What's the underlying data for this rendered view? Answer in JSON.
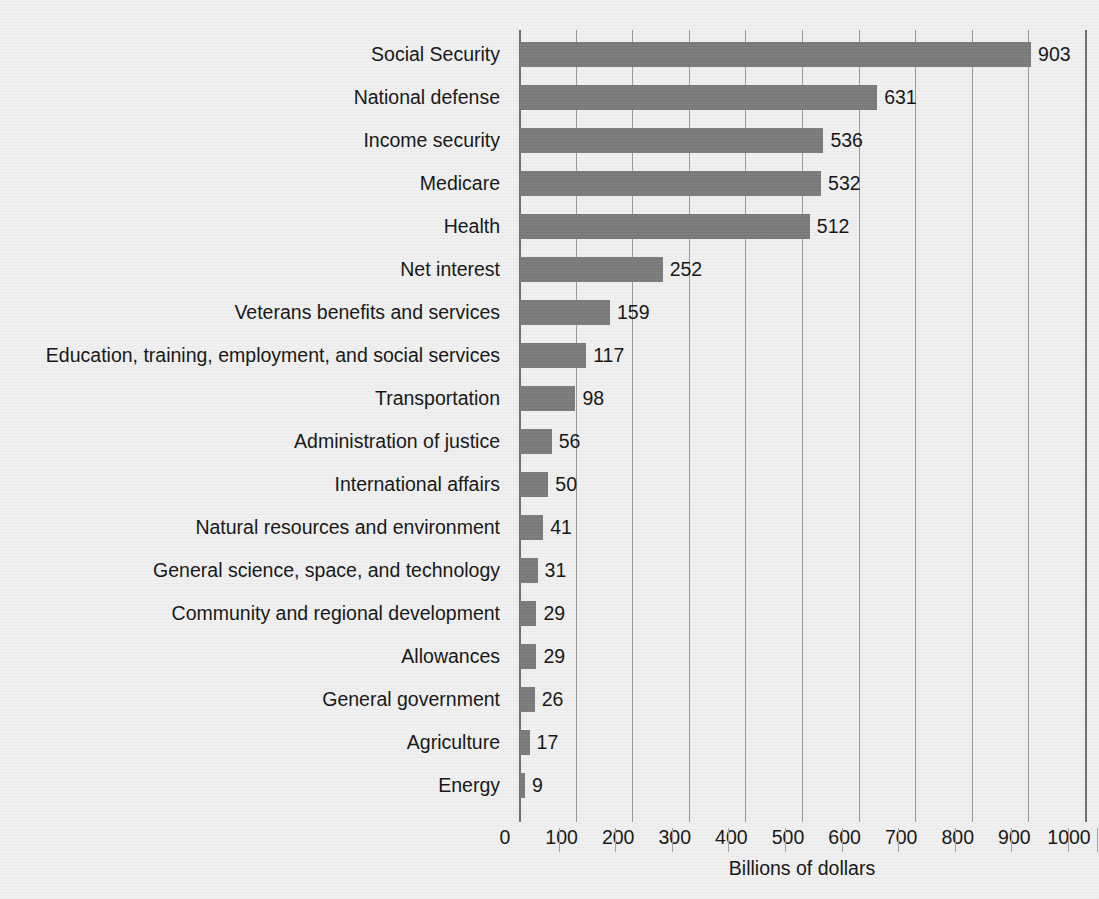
{
  "chart_data": {
    "type": "bar",
    "orientation": "horizontal",
    "title": "",
    "subtitle": "",
    "xlabel": "Billions of dollars",
    "ylabel": "",
    "xlim": [
      0,
      1000
    ],
    "xticks": [
      0,
      100,
      200,
      300,
      400,
      500,
      600,
      700,
      800,
      900,
      1000
    ],
    "xtick_labels": [
      "0",
      "100",
      "200",
      "300",
      "400",
      "500",
      "600",
      "700",
      "800",
      "900",
      "1000"
    ],
    "grid": true,
    "grid_axis": "x",
    "legend": false,
    "bar_color": "#7a7a7a",
    "background_color": "#eff0ef",
    "value_labels": true,
    "categories": [
      "Social Security",
      "National defense",
      "Income security",
      "Medicare",
      "Health",
      "Net interest",
      "Veterans benefits and services",
      "Education, training, employment, and social services",
      "Transportation",
      "Administration of justice",
      "International affairs",
      "Natural resources and environment",
      "General science, space, and technology",
      "Community and regional development",
      "Allowances",
      "General government",
      "Agriculture",
      "Energy"
    ],
    "values": [
      903,
      631,
      536,
      532,
      512,
      252,
      159,
      117,
      98,
      56,
      50,
      41,
      31,
      29,
      29,
      26,
      17,
      9
    ],
    "value_label_texts": [
      "903",
      "631",
      "536",
      "532",
      "512",
      "252",
      "159",
      "117",
      "98",
      "56",
      "50",
      "41",
      "31",
      "29",
      "29",
      "26",
      "17",
      "9"
    ]
  }
}
